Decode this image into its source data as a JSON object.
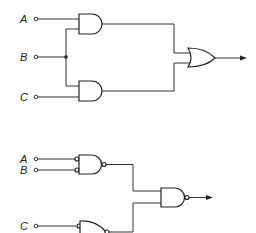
{
  "circuits": [
    {
      "name": "and-or-circuit",
      "inputs": [
        {
          "label": "A",
          "y": 19
        },
        {
          "label": "B",
          "y": 57
        },
        {
          "label": "C",
          "y": 97
        }
      ],
      "gates": [
        "AND (A,B)",
        "AND (B,C)",
        "OR"
      ],
      "output": "arrow"
    },
    {
      "name": "nand-circuit",
      "inputs": [
        {
          "label": "A",
          "y": 159
        },
        {
          "label": "B",
          "y": 170
        },
        {
          "label": "C",
          "y": 226
        }
      ],
      "gates": [
        "AND with inverted inputs and output (A,B)",
        "OR-shaped gate with inverted input and output (C)",
        "NAND"
      ],
      "output": "arrow"
    }
  ],
  "colors": {
    "line": "#333333",
    "background": "#ffffff"
  }
}
